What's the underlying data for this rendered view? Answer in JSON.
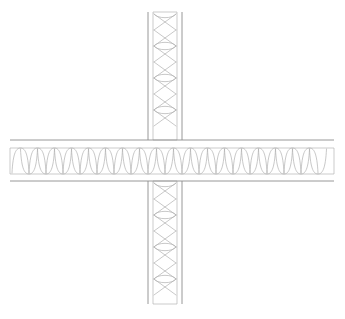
{
  "drawing": {
    "title": "Wall Intersection Detail",
    "type": "cad-section-detail",
    "canvas": {
      "width": 345,
      "height": 319,
      "background": "#ffffff"
    },
    "colors": {
      "background": "#ffffff",
      "outer_line": "#8c8c8c",
      "inner_line": "#a8a8a8",
      "hatch_line": "#b0b0b0"
    },
    "line_weights": {
      "outer": 0.9,
      "inner": 0.6,
      "hatch": 0.7
    },
    "elements": [
      {
        "name": "vertical-wall",
        "orientation": "vertical",
        "outer_left_x": 148,
        "outer_right_x": 182,
        "inner_left_x": 153,
        "inner_right_x": 177,
        "start_y": 12,
        "end_y": 304,
        "hatch": "batt-insulation-zigzag",
        "hatch_pitch": 16
      },
      {
        "name": "horizontal-wall",
        "orientation": "horizontal",
        "outer_top_y": 140,
        "outer_bottom_y": 181,
        "inner_top_y": 148,
        "inner_bottom_y": 174,
        "start_x": 10,
        "end_x": 334,
        "hatch": "batt-insulation-loop",
        "hatch_pitch": 17
      }
    ],
    "intersection": {
      "name": "cross-junction",
      "center_x": 165,
      "center_y": 160
    }
  }
}
